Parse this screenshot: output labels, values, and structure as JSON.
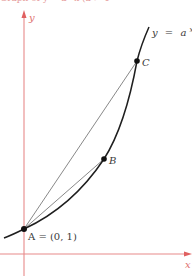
{
  "header": {
    "cut_off_text": "Graph of y = a^x (a > 1)"
  },
  "figure": {
    "curve_label_y": "y",
    "curve_label_eq": "=",
    "curve_label_base": "a",
    "curve_label_exp": "x",
    "axis_y_label": "y",
    "axis_x_label": "x",
    "point_a_label": "A = (0, 1)",
    "point_b_label": "B",
    "point_c_label": "C",
    "colors": {
      "axis": "#e88a8a",
      "curve": "#1f1f1f",
      "secant": "#555555",
      "point": "#111111"
    }
  }
}
